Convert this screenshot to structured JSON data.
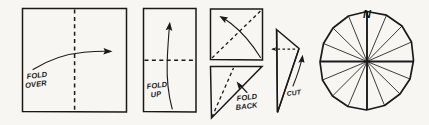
{
  "figure": {
    "background_color": "#f7f6f2",
    "ink_color": "#1a1a1a",
    "steps": [
      {
        "id": "step-1",
        "shape": "square",
        "crease": "vertical-dashed-center",
        "arrow": "curved-right",
        "label_line1": "FOLD",
        "label_line2": "OVER"
      },
      {
        "id": "step-2",
        "shape": "tall-rectangle",
        "crease": "horizontal-dashed-center",
        "arrow": "curved-up",
        "label_line1": "FOLD",
        "label_line2": "UP"
      },
      {
        "id": "step-3",
        "shape": "square",
        "crease": "diagonal-dashed",
        "arrow": "curved-up-left",
        "label_line1": "",
        "label_line2": ""
      },
      {
        "id": "step-4",
        "shape": "triangle",
        "crease": "diagonal-dashed",
        "arrow": "straight-up-left",
        "label_line1": "FOLD",
        "label_line2": "BACK"
      },
      {
        "id": "step-5",
        "shape": "wedge",
        "crease": "horizontal-dashed-cut",
        "arrow": "curved-up",
        "label_line1": "CUT",
        "label_line2": ""
      },
      {
        "id": "step-6",
        "shape": "compass-rose-circle",
        "spokes": 16,
        "label_line1": "N",
        "label_line2": ""
      }
    ]
  }
}
